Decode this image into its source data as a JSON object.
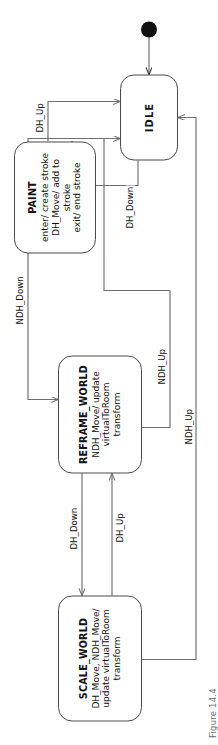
{
  "figure": {
    "caption": "Figure 14.4"
  },
  "diagram": {
    "type": "uml-state-machine",
    "orientation": "rotated-90-ccw",
    "line_color": "#6e6e6e",
    "state_border_color": "#4a4a4a",
    "text_color": "#121212",
    "caption_color": "#5d6f7d",
    "background": "#ffffff"
  },
  "states": [
    {
      "id": "scale_world",
      "name": "SCALE_WORLD",
      "body": "DH_Move, NDH_Move/\nupdate virtualToRoom\ntransform"
    },
    {
      "id": "reframe_world",
      "name": "REFRAME_WORLD",
      "body": "NDH_Move/ update\nvirtualToRoom\ntransform"
    },
    {
      "id": "paint",
      "name": "PAINT",
      "body": "enter/ create stroke\nDH_Move/ add to stroke\nexit/ end stroke"
    },
    {
      "id": "idle",
      "name": "IDLE",
      "body": ""
    }
  ],
  "transitions": [
    {
      "id": "t1",
      "from": "reframe_world",
      "to": "scale_world",
      "label": "DH_Down"
    },
    {
      "id": "t2",
      "from": "scale_world",
      "to": "reframe_world",
      "label": "DH_Up"
    },
    {
      "id": "t3",
      "from": "idle",
      "to": "reframe_world",
      "label": "NDH_Down"
    },
    {
      "id": "t4",
      "from": "reframe_world",
      "to": "idle",
      "label": "NDH_Up"
    },
    {
      "id": "t5",
      "from": "scale_world",
      "to": "idle",
      "label": "NDH_Up"
    },
    {
      "id": "t6",
      "from": "idle",
      "to": "paint",
      "label": "DH_Down"
    },
    {
      "id": "t7",
      "from": "paint",
      "to": "idle",
      "label": "DH_Up"
    }
  ],
  "initial_state": {
    "name": "initial-pseudostate",
    "target": "idle"
  }
}
